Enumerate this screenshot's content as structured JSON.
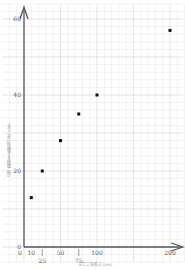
{
  "chart_data": {
    "type": "scatter",
    "title": "",
    "xlabel": "ふりこの長さ (cm)",
    "ylabel": "ふりこが10往復する時間 (秒)",
    "x": [
      10,
      25,
      50,
      75,
      100,
      200
    ],
    "y": [
      13,
      20,
      28,
      35,
      40,
      57
    ],
    "xlim": [
      0,
      210
    ],
    "ylim": [
      0,
      63
    ],
    "x_ticks": [
      0,
      10,
      25,
      50,
      75,
      100,
      200
    ],
    "x_tick_labels": [
      "0",
      "10",
      "25",
      "50",
      "75",
      "100",
      "200"
    ],
    "y_ticks": [
      0,
      20,
      40,
      60
    ],
    "y_tick_labels": [
      "0",
      "20",
      "40",
      "60"
    ],
    "grid": true,
    "legend": null
  },
  "colors": {
    "grid_minor": "#e4e4e4",
    "grid_major": "#c8c8c8",
    "axis": "#555555",
    "point": "#111111"
  }
}
